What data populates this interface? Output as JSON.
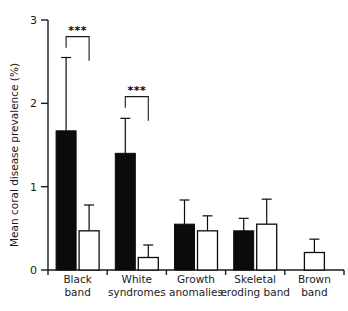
{
  "chart_data": {
    "type": "bar",
    "title": "",
    "subtitle": "",
    "xlabel": "",
    "ylabel": "Mean coral disease prevalence (%)",
    "ylim": [
      0,
      3
    ],
    "yticks": [
      0,
      1,
      2,
      3
    ],
    "ytick_labels": [
      "0",
      "1",
      "2",
      "3"
    ],
    "grid": false,
    "legend": null,
    "legend_position": "none",
    "categories": [
      "Black band",
      "White syndromes",
      "Growth anomalies",
      "Skeletal eroding band",
      "Brown band"
    ],
    "category_lines": [
      [
        "Black",
        "band"
      ],
      [
        "White",
        "syndromes"
      ],
      [
        "Growth",
        "anomalies"
      ],
      [
        "Skeletal",
        "eroding band"
      ],
      [
        "Brown",
        "band"
      ]
    ],
    "series": [
      {
        "name": "filled-black",
        "style": "solid black bar",
        "values": [
          1.67,
          1.4,
          0.55,
          0.47,
          null
        ],
        "error_upper": [
          2.55,
          1.82,
          0.84,
          0.62,
          null
        ]
      },
      {
        "name": "open-white",
        "style": "white bar with black outline",
        "values": [
          0.47,
          0.15,
          0.47,
          0.55,
          0.21
        ],
        "error_upper": [
          0.78,
          0.3,
          0.65,
          0.85,
          0.37
        ]
      }
    ],
    "annotations": [
      {
        "text": "***",
        "category": "Black band",
        "comparison": "filled-black vs open-white",
        "bracket_top": 2.8
      },
      {
        "text": "***",
        "category": "White syndromes",
        "comparison": "filled-black vs open-white",
        "bracket_top": 2.08
      }
    ]
  },
  "axis": {
    "y_title": "Mean coral disease prevalence (%)"
  }
}
